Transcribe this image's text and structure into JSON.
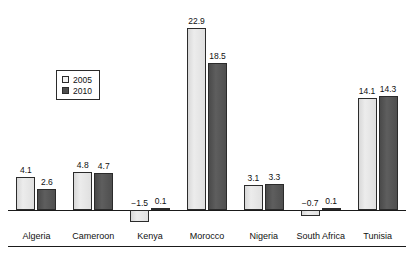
{
  "chart_data": {
    "type": "bar",
    "title": "",
    "subtitle": "",
    "xlabel": "",
    "ylabel": "",
    "grid": false,
    "legend_position": "inside-upper-left",
    "ylim": [
      -2.5,
      24.5
    ],
    "categories": [
      "Algeria",
      "Cameroon",
      "Kenya",
      "Morocco",
      "Nigeria",
      "South Africa",
      "Tunisia"
    ],
    "series": [
      {
        "name": "2005",
        "color": "#e2e2e2",
        "values": [
          4.1,
          4.8,
          -1.5,
          22.9,
          3.1,
          -0.7,
          14.1
        ],
        "labels": [
          "4.1",
          "4.8",
          "−1.5",
          "22.9",
          "3.1",
          "−0.7",
          "14.1"
        ]
      },
      {
        "name": "2010",
        "color": "#555555",
        "values": [
          2.6,
          4.7,
          0.1,
          18.5,
          3.3,
          0.1,
          14.3
        ],
        "labels": [
          "2.6",
          "4.7",
          "0.1",
          "18.5",
          "3.3",
          "0.1",
          "14.3"
        ]
      }
    ]
  },
  "legend": {
    "items": [
      {
        "label": "2005",
        "swatch": "light-square-icon"
      },
      {
        "label": "2010",
        "swatch": "dark-square-icon"
      }
    ]
  },
  "axis": {
    "zero_line_label": "0"
  }
}
